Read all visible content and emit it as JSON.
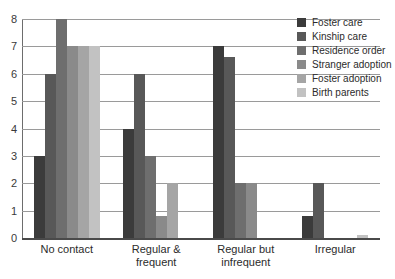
{
  "chart_data": {
    "type": "bar",
    "title": "",
    "xlabel": "",
    "ylabel": "",
    "ylim": [
      0,
      8
    ],
    "yticks": [
      0,
      1,
      2,
      3,
      4,
      5,
      6,
      7,
      8
    ],
    "grid": true,
    "legend_position": "top-right",
    "categories": [
      "No contact",
      "Regular & frequent",
      "Regular but infrequent",
      "Irregular"
    ],
    "category_lines": [
      [
        "No contact"
      ],
      [
        "Regular &",
        "frequent"
      ],
      [
        "Regular but",
        "infrequent"
      ],
      [
        "Irregular"
      ]
    ],
    "series": [
      {
        "name": "Foster care",
        "color": "#3b3b3b",
        "values": [
          3,
          4,
          7,
          0.8
        ]
      },
      {
        "name": "Kinship care",
        "color": "#585858",
        "values": [
          6,
          6,
          6.6,
          2
        ]
      },
      {
        "name": "Residence order",
        "color": "#6e6e6e",
        "values": [
          8,
          3,
          2,
          0
        ]
      },
      {
        "name": "Stranger adoption",
        "color": "#8a8a8a",
        "values": [
          7,
          0.8,
          2,
          0
        ]
      },
      {
        "name": "Foster adoption",
        "color": "#a5a5a5",
        "values": [
          7,
          2,
          0,
          0
        ]
      },
      {
        "name": "Birth parents",
        "color": "#c2c2c2",
        "values": [
          7,
          0,
          0,
          0.1
        ]
      }
    ]
  },
  "axis": {
    "tick_labels": [
      "0",
      "1",
      "2",
      "3",
      "4",
      "5",
      "6",
      "7",
      "8"
    ]
  }
}
